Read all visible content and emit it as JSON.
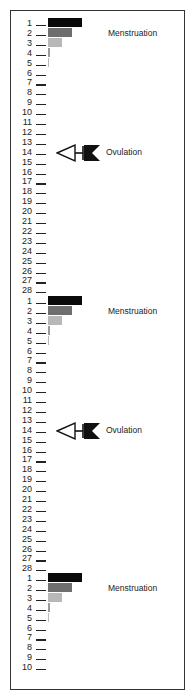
{
  "diagram": {
    "title": "",
    "day_spacing_px": 9.9,
    "cycles": [
      {
        "start_y": 24,
        "days": [
          "1",
          "2",
          "3",
          "4",
          "5",
          "6",
          "7",
          "8",
          "9",
          "10",
          "11",
          "12",
          "13",
          "14",
          "15",
          "16",
          "17",
          "18",
          "19",
          "20",
          "21",
          "22",
          "23",
          "24",
          "25",
          "26",
          "27",
          "28"
        ],
        "menstruation_label": "Menstruation",
        "ovulation_label": "Ovulation",
        "ovulation_day": 14
      },
      {
        "start_y": 302,
        "days": [
          "1",
          "2",
          "3",
          "4",
          "5",
          "6",
          "7",
          "8",
          "9",
          "10",
          "11",
          "12",
          "13",
          "14",
          "15",
          "16",
          "17",
          "18",
          "19",
          "20",
          "21",
          "22",
          "23",
          "24",
          "25",
          "26",
          "27",
          "28"
        ],
        "menstruation_label": "Menstruation",
        "ovulation_label": "Ovulation",
        "ovulation_day": 14
      },
      {
        "start_y": 579,
        "days": [
          "1",
          "2",
          "3",
          "4",
          "5",
          "6",
          "7",
          "8",
          "9",
          "10"
        ],
        "menstruation_label": "Menstruation",
        "ovulation_label": null,
        "ovulation_day": null
      }
    ],
    "menstrual_flow_bars": [
      {
        "day": 1,
        "width": 34,
        "color": "#0a0a0a"
      },
      {
        "day": 2,
        "width": 24,
        "color": "#6e6e6e"
      },
      {
        "day": 3,
        "width": 14,
        "color": "#b8b8b8"
      },
      {
        "day": 4,
        "width": 2,
        "color": "#9a9a9a"
      },
      {
        "day": 5,
        "width": 1,
        "color": "#bbbbbb"
      }
    ],
    "icons": {
      "ovulation": "egg-release-arrow-icon"
    }
  }
}
